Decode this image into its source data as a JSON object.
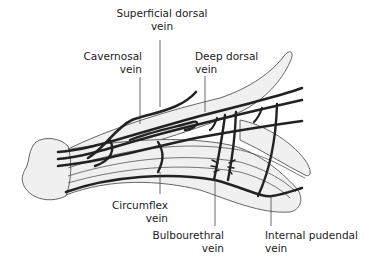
{
  "diagram": {
    "type": "anatomical illustration",
    "colors": {
      "fill": "#f0f0f0",
      "outline": "#555555",
      "vein": "#222222",
      "leader": "#444444",
      "text": "#222222"
    },
    "labels": {
      "superficial_dorsal": {
        "line1": "Superficial dorsal",
        "line2": "vein"
      },
      "cavernosal": {
        "line1": "Cavernosal",
        "line2": "vein"
      },
      "deep_dorsal": {
        "line1": "Deep dorsal",
        "line2": "vein"
      },
      "circumflex": {
        "line1": "Circumflex",
        "line2": "vein"
      },
      "bulbourethral": {
        "line1": "Bulbourethral",
        "line2": "vein"
      },
      "internal_pudendal": {
        "line1": "Internal pudendal",
        "line2": "vein"
      }
    }
  }
}
